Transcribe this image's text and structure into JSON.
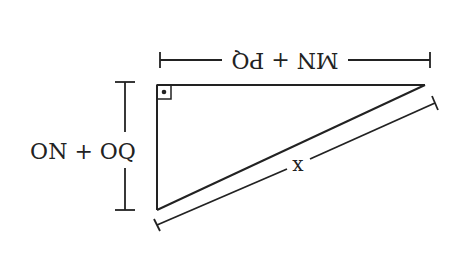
{
  "diagram": {
    "type": "right-triangle",
    "colors": {
      "stroke": "#222222",
      "background": "#ffffff"
    },
    "labels": {
      "top_side": "MN + PQ",
      "left_side": "ON + OQ",
      "hypotenuse": "x"
    },
    "orientation_note": "labels render upside-down",
    "right_angle_marker": "square-with-dot"
  }
}
